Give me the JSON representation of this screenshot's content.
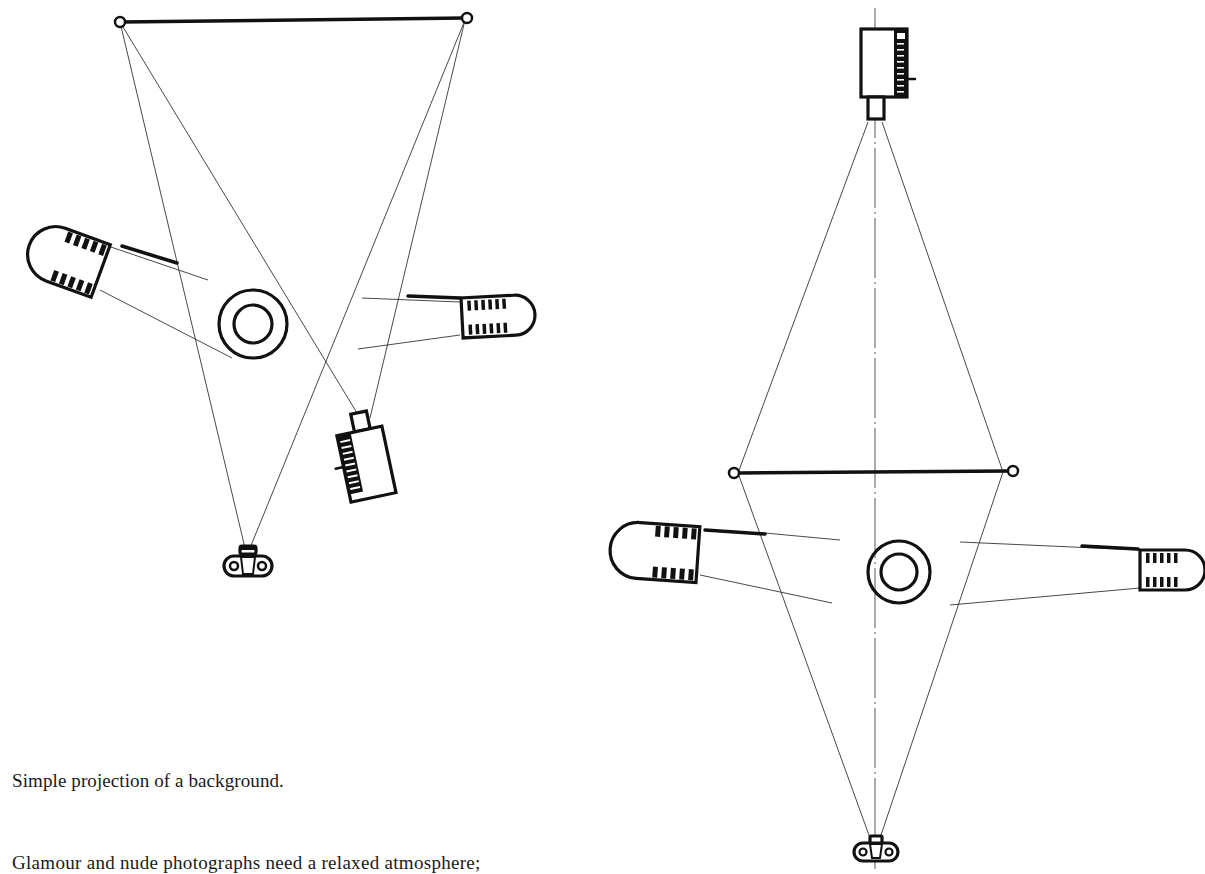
{
  "page": {
    "caption": "Simple projection of a background.",
    "body_text": "Glamour and nude photographs need a relaxed atmosphere;"
  },
  "diagrams": [
    {
      "name": "simple-background-projection",
      "elements": [
        "background-screen",
        "projector",
        "subject",
        "left-spotlight",
        "right-spotlight",
        "camera"
      ]
    },
    {
      "name": "front-projection-symmetric",
      "elements": [
        "projector",
        "optical-axis",
        "background-screen",
        "subject",
        "left-spotlight",
        "right-spotlight",
        "camera"
      ]
    }
  ]
}
